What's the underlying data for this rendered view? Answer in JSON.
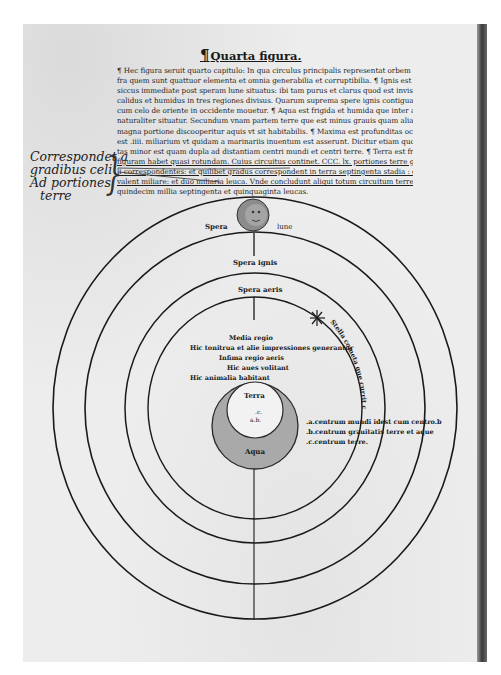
{
  "page": {
    "heading": "Quarta figura.",
    "heading_mark": "¶",
    "body_lines": [
      {
        "text": "¶ Hec figura seruit quarto capitulo: In qua circulus principalis representat orbem lune : in",
        "underline": false
      },
      {
        "text": "fra quem sunt quattuor elementa et omnia generabilia et corruptibilia. ¶ Ignis est calidus et",
        "underline": false
      },
      {
        "text": "siccus immediate post speram lune situatus: ibi tam purus et clarus quod est invisibilis. ¶ Aer est",
        "underline": false
      },
      {
        "text": "calidus et humidus in tres regiones divisus. Quarum suprema spere ignis contigua et vtraque",
        "underline": false
      },
      {
        "text": "cum celo de oriente in occidente mouetur. ¶ Aqua est frigida et humida que inter aerem et terram",
        "underline": false
      },
      {
        "text": "naturaliter situatur. Secundum vnam partem terre que est minus grauis quam alia supereminet et pro",
        "underline": false
      },
      {
        "text": "magna portione discooperitur aquis vt sit habitabilis. ¶ Maxima est profunditas oceani",
        "underline": false
      },
      {
        "text": "est .iiii. miliarium vt quidam a marinariis inuentum est asserunt. Dicitur etiam quod eadem profundi",
        "underline": false
      },
      {
        "text": "tas minor est quam dupla ad distantiam centri mundi et centri terre. ¶ Terra est frigida et sicca que",
        "underline": false
      },
      {
        "text": "figuram habet quasi rotundam. Cuius circuitus continet. CCC. lx. portiones terre gradibus ce",
        "underline": true
      },
      {
        "text": "li correspondentes: et quilibet gradus correspondent in terra septingenta stadia : quorum octo",
        "underline": true
      },
      {
        "text": "valent miliare: et duo miliaria leuca. Vnde concludunt aliqui totum circuitum terre continere",
        "underline": true
      },
      {
        "text": "quindecim millia septingenta et quinquaginta leucas.",
        "underline": false
      }
    ],
    "margin_note": [
      "Correspondet a",
      "gradibus celi",
      "Ad portiones",
      "terre"
    ],
    "margin_note_mark": "Nota"
  },
  "diagram": {
    "spheres": [
      {
        "name": "spera-lune",
        "label_left": "Spera",
        "label_right": "lune"
      },
      {
        "name": "spera-ignis",
        "label": "Spera ignis"
      },
      {
        "name": "spera-aeris",
        "label": "Spera aeris"
      }
    ],
    "air_regions": [
      "Media regio",
      "Hic tonitrua et alie impressiones generantur",
      "Infima regio aeris",
      "Hic aues volitant",
      "Hic animalia habitant"
    ],
    "comet_text": "Stella cometa que currit cum celo mo",
    "earth_label": "Terra",
    "water_label": "Aqua",
    "center_marks": [
      ".c.",
      "a.b."
    ],
    "legend": [
      ".a.centrum mundi idest cum centro.b",
      ".b.centrum grauitatis terre et aque",
      ".c.centrum terre."
    ],
    "colors": {
      "ink": "#1a1a1a",
      "paper": "#ededed",
      "water_fill": "#a9a9a9",
      "moon_fill": "#8c8c8c"
    }
  }
}
